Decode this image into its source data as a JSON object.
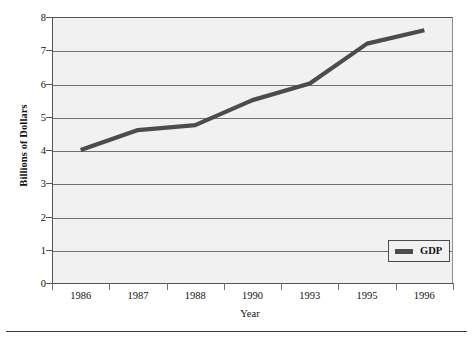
{
  "chart_data": {
    "type": "line",
    "title": "",
    "subtitle": "",
    "xlabel": "Year",
    "ylabel": "Billions of Dollars",
    "categories": [
      "1986",
      "1987",
      "1988",
      "1990",
      "1993",
      "1995",
      "1996"
    ],
    "series": [
      {
        "name": "GDP",
        "values": [
          4.0,
          4.6,
          4.75,
          5.5,
          6.0,
          7.2,
          7.6
        ],
        "color": "#4c4c4c"
      }
    ],
    "ylim": [
      0,
      8
    ],
    "ytick_labels": [
      "0",
      "1",
      "2",
      "3",
      "4",
      "5",
      "6",
      "7",
      "8"
    ],
    "ytick_values": [
      0,
      1,
      2,
      3,
      4,
      5,
      6,
      7,
      8
    ],
    "grid": true,
    "grid_axis": "y",
    "legend_position": "bottom-right",
    "plot_background": "#f1f1f1",
    "grid_color": "#6f6f6f",
    "axis_color": "#555555"
  },
  "legend": {
    "entries": [
      {
        "label": "GDP",
        "swatch_color": "#4c4c4c"
      }
    ]
  },
  "axes": {
    "x_title": "Year",
    "y_title": "Billions of Dollars"
  }
}
